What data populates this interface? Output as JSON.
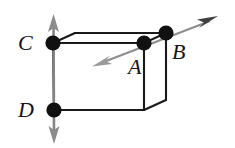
{
  "figure": {
    "kind": "geometry-diagram",
    "background_color": "#ffffff",
    "line_color": "#1a1a1a",
    "arrow_vertical_color": "#808080",
    "arrow_diagonal_color": "#8a8a8a",
    "arrow_diagonal_head_color": "#3c3c3c",
    "point_color": "#111111",
    "point_radius": 7.5,
    "points": [
      {
        "id": "C",
        "label": "C",
        "x": 53,
        "y": 43,
        "label_x": 18,
        "label_y": 32
      },
      {
        "id": "D",
        "label": "D",
        "x": 54,
        "y": 110,
        "label_x": 18,
        "label_y": 99
      },
      {
        "id": "A",
        "label": "A",
        "x": 144,
        "y": 43,
        "label_x": 128,
        "label_y": 56
      },
      {
        "id": "B",
        "label": "B",
        "x": 166,
        "y": 33,
        "label_x": 172,
        "label_y": 41
      }
    ],
    "box_edges": {
      "front_top_left": {
        "x": 53,
        "y": 43
      },
      "front_top_right": {
        "x": 144,
        "y": 43
      },
      "front_bottom_left": {
        "x": 54,
        "y": 110
      },
      "front_bottom_right": {
        "x": 144,
        "y": 110
      },
      "back_top_left": {
        "x": 75,
        "y": 33
      },
      "back_top_right": {
        "x": 166,
        "y": 33
      },
      "back_bottom_right": {
        "x": 166,
        "y": 100
      }
    },
    "vertical_arrow": {
      "name": "double-headed-vertical-arrow",
      "top": {
        "x": 53,
        "y": 18
      },
      "bottom": {
        "x": 54,
        "y": 140
      },
      "heads": [
        "up",
        "down"
      ]
    },
    "diagonal_arrow": {
      "name": "double-headed-diagonal-arrow",
      "start": {
        "x": 96,
        "y": 65
      },
      "end": {
        "x": 216,
        "y": 18
      },
      "heads": [
        "down-left",
        "up-right"
      ]
    }
  }
}
